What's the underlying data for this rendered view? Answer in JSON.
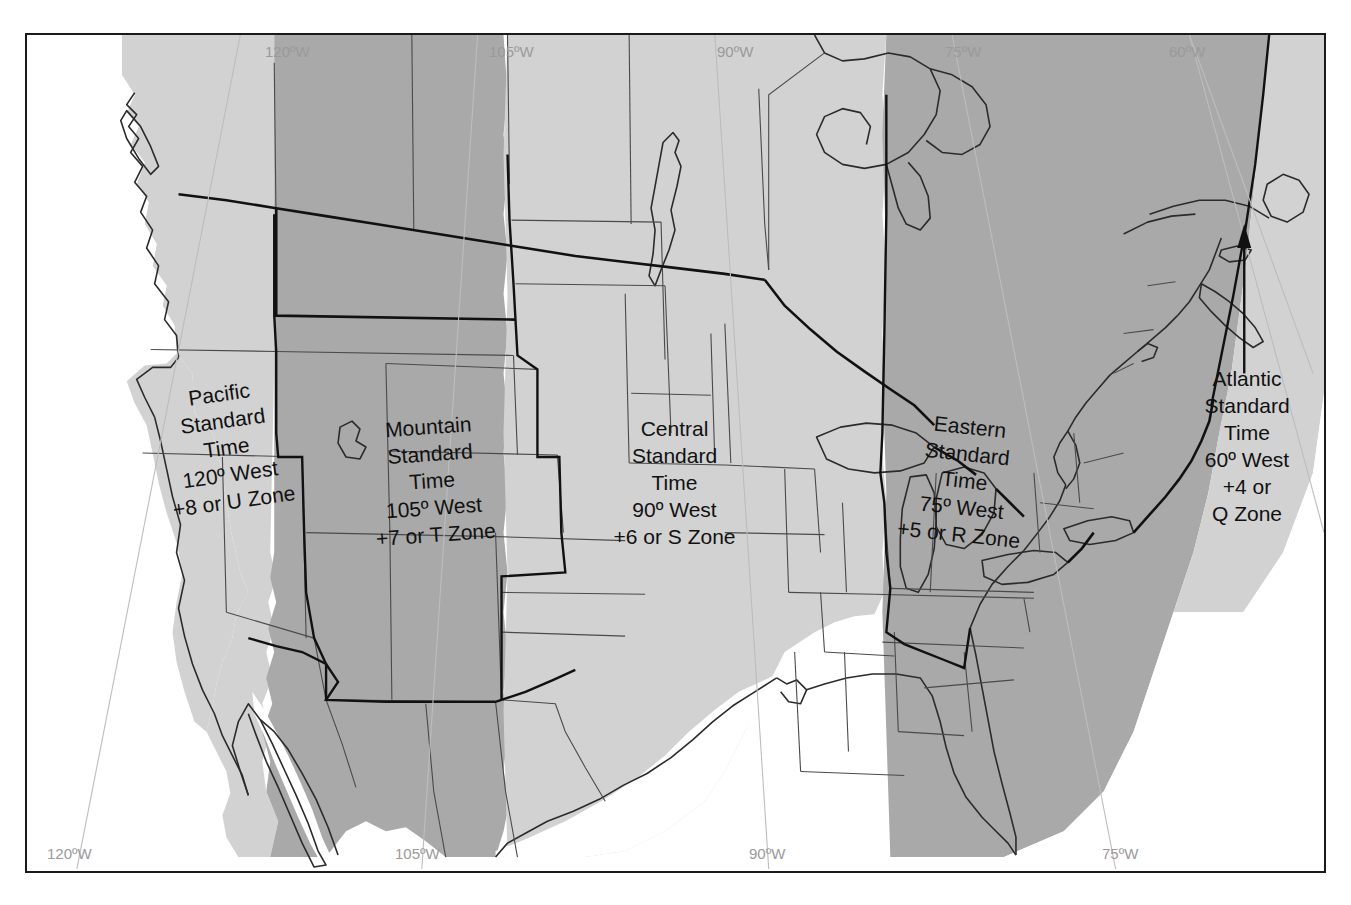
{
  "map": {
    "title": "North American Standard Time Zones",
    "frame": {
      "border_color": "#1a1a1a"
    },
    "colors": {
      "land_light": "#d2d2d2",
      "land_dark": "#a9a9a9",
      "water": "#ffffff",
      "border_line": "#2b2b2b",
      "meridian_line": "#b9b9b9",
      "meridian_text": "#9a9a9a",
      "label_text": "#111111"
    },
    "zone_labels": [
      {
        "id": "pacific",
        "name": "Pacific Standard Time",
        "lines": [
          "Pacific",
          "Standard",
          "Time",
          "120º West",
          "+8 or U Zone"
        ],
        "meridian": "120º West",
        "offset": "+8",
        "zone_letter": "U Zone",
        "rotation_deg": -8
      },
      {
        "id": "mountain",
        "name": "Mountain Standard Time",
        "lines": [
          "Mountain",
          "Standard",
          "Time",
          "105º West",
          "+7 or T Zone"
        ],
        "meridian": "105º West",
        "offset": "+7",
        "zone_letter": "T Zone",
        "rotation_deg": -4
      },
      {
        "id": "central",
        "name": "Central Standard Time",
        "lines": [
          "Central",
          "Standard",
          "Time",
          "90º West",
          "+6 or S Zone"
        ],
        "meridian": "90º West",
        "offset": "+6",
        "zone_letter": "S Zone",
        "rotation_deg": 0
      },
      {
        "id": "eastern",
        "name": "Eastern Standard Time",
        "lines": [
          "Eastern",
          "Standard",
          "Time",
          "75º West",
          "+5 or R Zone"
        ],
        "meridian": "75º West",
        "offset": "+5",
        "zone_letter": "R Zone",
        "rotation_deg": 6
      },
      {
        "id": "atlantic",
        "name": "Atlantic Standard Time",
        "lines": [
          "Atlantic",
          "Standard",
          "Time",
          "60º West",
          "+4 or",
          "Q Zone"
        ],
        "meridian": "60º West",
        "offset": "+4",
        "zone_letter": "Q Zone",
        "rotation_deg": 0
      }
    ],
    "meridians_top": [
      "120ºW",
      "105ºW",
      "90ºW",
      "75ºW",
      "60ºW"
    ],
    "meridians_bottom": [
      "120ºW",
      "105ºW",
      "90ºW",
      "75ºW"
    ],
    "annotations": {
      "atlantic_arrow": "arrow pointing to Atlantic provinces"
    }
  }
}
